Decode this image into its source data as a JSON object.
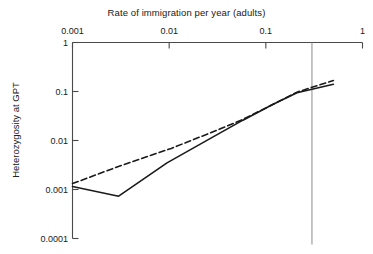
{
  "chart_data": {
    "type": "line",
    "title": "Rate of immigration per year (adults)",
    "xlabel": "Rate of immigration per year (adults)",
    "ylabel": "Heterozygosity at GPT",
    "xscale": "log",
    "yscale": "log",
    "xlim": [
      0.001,
      1
    ],
    "ylim": [
      0.0001,
      1
    ],
    "xticks": [
      0.001,
      0.01,
      0.1,
      1
    ],
    "xtick_labels": [
      "0.001",
      "0.01",
      "0.1",
      "1"
    ],
    "yticks": [
      1,
      0.1,
      0.01,
      0.001,
      0.0001
    ],
    "ytick_labels": [
      "1",
      "0.1",
      "0.01",
      "0.001",
      "0.0001"
    ],
    "grid": false,
    "legend": null,
    "axis_position": {
      "x_axis": "top",
      "y_axis": "left"
    },
    "annotations": [
      {
        "type": "vertical-reference-line",
        "x": 0.3,
        "label": ""
      }
    ],
    "series": [
      {
        "name": "solid-curve",
        "style": "solid",
        "color": "#1a1a1a",
        "points": [
          {
            "x": 0.001,
            "y": 0.00115
          },
          {
            "x": 0.003,
            "y": 0.00073
          },
          {
            "x": 0.0095,
            "y": 0.0035
          },
          {
            "x": 0.032,
            "y": 0.0135
          },
          {
            "x": 0.058,
            "y": 0.026
          },
          {
            "x": 0.115,
            "y": 0.053
          },
          {
            "x": 0.21,
            "y": 0.094
          },
          {
            "x": 0.5,
            "y": 0.141
          }
        ]
      },
      {
        "name": "dashed-curve",
        "style": "dashed",
        "color": "#1a1a1a",
        "points": [
          {
            "x": 0.001,
            "y": 0.00132
          },
          {
            "x": 0.0032,
            "y": 0.0031
          },
          {
            "x": 0.0105,
            "y": 0.0069
          },
          {
            "x": 0.032,
            "y": 0.0165
          },
          {
            "x": 0.058,
            "y": 0.027
          },
          {
            "x": 0.115,
            "y": 0.053
          },
          {
            "x": 0.21,
            "y": 0.097
          },
          {
            "x": 0.5,
            "y": 0.168
          }
        ]
      }
    ]
  },
  "axes": {
    "title_text": "Rate of immigration per year (adults)",
    "y_axis_title": "Heterozygosity at GPT",
    "x_labels": [
      "0.001",
      "0.01",
      "0.1",
      "1"
    ],
    "y_labels": [
      "1",
      "0.1",
      "0.01",
      "0.001",
      "0.0001"
    ]
  },
  "colors": {
    "axis": "#4a4a4a",
    "line": "#1a1a1a",
    "reference_line": "#8a8a8a",
    "background": "#ffffff"
  }
}
